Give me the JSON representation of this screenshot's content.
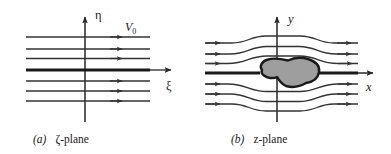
{
  "figure": {
    "type": "diagram",
    "background_color": "#ffffff",
    "line_color": "#262626",
    "axis_color": "#262626",
    "streamline_color": "#333333",
    "body_fill_color": "#9e9e9e",
    "body_stroke_color": "#1a1a1a"
  },
  "panel_a": {
    "caption_label": "(a)",
    "caption_text": "ζ-plane",
    "vertical_axis_label": "η",
    "horizontal_axis_label": "ξ",
    "velocity_label": "V",
    "velocity_subscript": "0",
    "streamline_count": 7,
    "streamline_rows": [
      37,
      49,
      58,
      70,
      81,
      91,
      101
    ],
    "center_streamline_index": 3,
    "arrow_x": 121,
    "line_start_x": 26,
    "line_end_x": 150,
    "axis_x": 85,
    "axis_top_y": 14,
    "axis_bottom_y": 122,
    "axis_right_x": 170
  },
  "panel_b": {
    "caption_label": "(b)",
    "caption_text": "z-plane",
    "vertical_axis_label": "y",
    "horizontal_axis_label": "x",
    "streamline_count": 7,
    "center_streamline_index": 3,
    "body_shape": "irregular closed blob",
    "axis_x": 277,
    "axis_top_y": 14,
    "axis_bottom_y": 122,
    "axis_right_x": 372,
    "line_start_x": 205,
    "line_end_x": 358,
    "body_bounds": {
      "x0": 256,
      "y0": 58,
      "x1": 321,
      "y1": 90
    }
  }
}
